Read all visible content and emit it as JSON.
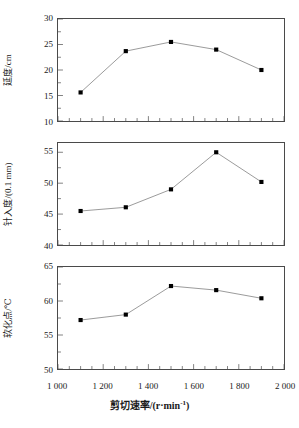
{
  "figure": {
    "background": "#ffffff",
    "line_color": "#808080",
    "marker_color": "#000000",
    "axis_color": "#4a4a4a",
    "xlabel": "剪切速率/(r·min",
    "xlabel_sup": "-1",
    "xlabel_tail": ")",
    "x_ticklabels": [
      "1 000",
      "1 200",
      "1 400",
      "1 600",
      "1 800",
      "2 000"
    ],
    "x_tickvalues": [
      1000,
      1200,
      1400,
      1600,
      1800,
      2000
    ]
  },
  "chart_data": [
    {
      "type": "line",
      "panel": 0,
      "title": "",
      "xlabel": "剪切速率/(r·min⁻¹)",
      "ylabel": "延度/cm",
      "x": [
        1100,
        1300,
        1500,
        1700,
        1900
      ],
      "values": [
        15.6,
        23.7,
        25.5,
        24.0,
        20.0
      ],
      "series": [
        {
          "name": "延度",
          "values": [
            15.6,
            23.7,
            25.5,
            24.0,
            20.0
          ]
        }
      ],
      "xlim": [
        1000,
        2000
      ],
      "ylim": [
        10,
        30
      ],
      "yticks": [
        10,
        15,
        20,
        25,
        30
      ],
      "yticklabels": [
        "10",
        "15",
        "20",
        "25",
        "30"
      ],
      "grid": false,
      "legend": "none",
      "marker": "square"
    },
    {
      "type": "line",
      "panel": 1,
      "title": "",
      "xlabel": "剪切速率/(r·min⁻¹)",
      "ylabel": "针入度/(0.1 mm)",
      "x": [
        1100,
        1300,
        1500,
        1700,
        1900
      ],
      "values": [
        45.5,
        46.1,
        49.0,
        55.0,
        50.2
      ],
      "series": [
        {
          "name": "针入度",
          "values": [
            45.5,
            46.1,
            49.0,
            55.0,
            50.2
          ]
        }
      ],
      "xlim": [
        1000,
        2000
      ],
      "ylim": [
        40,
        56.5
      ],
      "yticks": [
        40,
        45,
        50,
        55
      ],
      "yticklabels": [
        "40",
        "45",
        "50",
        "55"
      ],
      "grid": false,
      "legend": "none",
      "marker": "square"
    },
    {
      "type": "line",
      "panel": 2,
      "title": "",
      "xlabel": "剪切速率/(r·min⁻¹)",
      "ylabel": "软化点/℃",
      "x": [
        1100,
        1300,
        1500,
        1700,
        1900
      ],
      "values": [
        57.2,
        58.0,
        62.2,
        61.6,
        60.4
      ],
      "series": [
        {
          "name": "软化点",
          "values": [
            57.2,
            58.0,
            62.2,
            61.6,
            60.4
          ]
        }
      ],
      "xlim": [
        1000,
        2000
      ],
      "ylim": [
        50,
        65
      ],
      "yticks": [
        50,
        55,
        60,
        65
      ],
      "yticklabels": [
        "50",
        "55",
        "60",
        "65"
      ],
      "grid": false,
      "legend": "none",
      "marker": "square"
    }
  ]
}
